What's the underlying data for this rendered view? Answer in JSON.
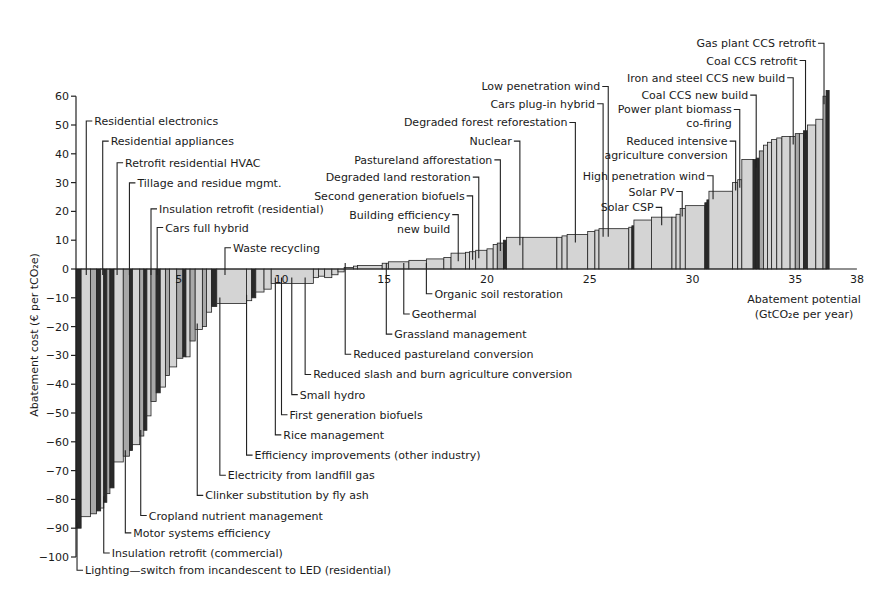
{
  "chart_data": {
    "type": "bar",
    "subtype": "marginal-abatement-cost-curve",
    "title": "",
    "xlabel": "Abatement potential (GtCO2e per year)",
    "xlabel_lines": [
      "Abatement potential",
      "(GtCO₂e per year)"
    ],
    "ylabel": "Abatement cost (€ per tCO₂e)",
    "xlim": [
      0,
      38
    ],
    "ylim": [
      -100,
      60
    ],
    "x_ticks": [
      5,
      10,
      15,
      20,
      25,
      30,
      35,
      38
    ],
    "y_ticks": [
      60,
      50,
      40,
      30,
      20,
      10,
      0,
      -10,
      -20,
      -30,
      -40,
      -50,
      -60,
      -70,
      -80,
      -90,
      -100
    ],
    "grid": false,
    "legend": null,
    "bars": [
      {
        "x": 0.0,
        "w": 0.25,
        "cost": -90,
        "shade": "dark"
      },
      {
        "x": 0.25,
        "w": 0.45,
        "cost": -86,
        "shade": "light"
      },
      {
        "x": 0.7,
        "w": 0.3,
        "cost": -85,
        "shade": "mid"
      },
      {
        "x": 1.0,
        "w": 0.2,
        "cost": -84,
        "shade": "dark"
      },
      {
        "x": 1.2,
        "w": 0.15,
        "cost": -83,
        "shade": "light"
      },
      {
        "x": 1.35,
        "w": 0.15,
        "cost": -81,
        "shade": "dark"
      },
      {
        "x": 1.5,
        "w": 0.15,
        "cost": -78,
        "shade": "mid"
      },
      {
        "x": 1.65,
        "w": 0.2,
        "cost": -76,
        "shade": "dark"
      },
      {
        "x": 1.85,
        "w": 0.45,
        "cost": -67,
        "shade": "light"
      },
      {
        "x": 2.3,
        "w": 0.3,
        "cost": -65,
        "shade": "mid"
      },
      {
        "x": 2.6,
        "w": 0.15,
        "cost": -63,
        "shade": "dark"
      },
      {
        "x": 2.75,
        "w": 0.35,
        "cost": -61,
        "shade": "light"
      },
      {
        "x": 3.1,
        "w": 0.2,
        "cost": -58,
        "shade": "mid"
      },
      {
        "x": 3.3,
        "w": 0.15,
        "cost": -56,
        "shade": "dark"
      },
      {
        "x": 3.45,
        "w": 0.2,
        "cost": -51,
        "shade": "light"
      },
      {
        "x": 3.65,
        "w": 0.25,
        "cost": -46,
        "shade": "mid"
      },
      {
        "x": 3.9,
        "w": 0.2,
        "cost": -43,
        "shade": "dark"
      },
      {
        "x": 4.1,
        "w": 0.25,
        "cost": -41,
        "shade": "light"
      },
      {
        "x": 4.35,
        "w": 0.2,
        "cost": -37,
        "shade": "mid"
      },
      {
        "x": 4.55,
        "w": 0.35,
        "cost": -34,
        "shade": "light"
      },
      {
        "x": 4.9,
        "w": 0.3,
        "cost": -31,
        "shade": "mid"
      },
      {
        "x": 5.2,
        "w": 0.15,
        "cost": -30.5,
        "shade": "dark"
      },
      {
        "x": 5.35,
        "w": 0.2,
        "cost": -30.5,
        "shade": "light"
      },
      {
        "x": 5.55,
        "w": 0.25,
        "cost": -25,
        "shade": "mid"
      },
      {
        "x": 5.8,
        "w": 0.35,
        "cost": -21,
        "shade": "light"
      },
      {
        "x": 6.15,
        "w": 0.2,
        "cost": -20,
        "shade": "mid"
      },
      {
        "x": 6.35,
        "w": 0.25,
        "cost": -15,
        "shade": "light"
      },
      {
        "x": 6.6,
        "w": 0.25,
        "cost": -13,
        "shade": "dark"
      },
      {
        "x": 6.85,
        "w": 1.45,
        "cost": -12,
        "shade": "light"
      },
      {
        "x": 8.3,
        "w": 0.25,
        "cost": -11,
        "shade": "light"
      },
      {
        "x": 8.55,
        "w": 0.2,
        "cost": -10,
        "shade": "dark"
      },
      {
        "x": 8.75,
        "w": 0.4,
        "cost": -8,
        "shade": "light"
      },
      {
        "x": 9.15,
        "w": 0.35,
        "cost": -7,
        "shade": "light"
      },
      {
        "x": 9.5,
        "w": 2.05,
        "cost": -5,
        "shade": "light"
      },
      {
        "x": 11.55,
        "w": 0.25,
        "cost": -3,
        "shade": "light"
      },
      {
        "x": 11.8,
        "w": 0.3,
        "cost": -2.5,
        "shade": "light"
      },
      {
        "x": 12.1,
        "w": 0.35,
        "cost": -3,
        "shade": "light"
      },
      {
        "x": 12.45,
        "w": 0.3,
        "cost": -2,
        "shade": "light"
      },
      {
        "x": 12.75,
        "w": 0.3,
        "cost": -1,
        "shade": "light"
      },
      {
        "x": 13.05,
        "w": 0.45,
        "cost": 0.5,
        "shade": "light"
      },
      {
        "x": 13.5,
        "w": 0.2,
        "cost": 1,
        "shade": "light"
      },
      {
        "x": 13.7,
        "w": 1.2,
        "cost": 1.2,
        "shade": "light"
      },
      {
        "x": 14.9,
        "w": 0.3,
        "cost": 2,
        "shade": "light"
      },
      {
        "x": 15.2,
        "w": 1.0,
        "cost": 2.5,
        "shade": "light"
      },
      {
        "x": 16.2,
        "w": 0.85,
        "cost": 3,
        "shade": "light"
      },
      {
        "x": 17.05,
        "w": 0.85,
        "cost": 3.5,
        "shade": "light"
      },
      {
        "x": 17.9,
        "w": 0.35,
        "cost": 4,
        "shade": "light"
      },
      {
        "x": 18.25,
        "w": 0.7,
        "cost": 5.5,
        "shade": "light"
      },
      {
        "x": 18.95,
        "w": 0.2,
        "cost": 5.8,
        "shade": "light"
      },
      {
        "x": 19.15,
        "w": 0.3,
        "cost": 6,
        "shade": "light"
      },
      {
        "x": 19.45,
        "w": 0.55,
        "cost": 6.5,
        "shade": "light"
      },
      {
        "x": 20.0,
        "w": 0.3,
        "cost": 7,
        "shade": "light"
      },
      {
        "x": 20.3,
        "w": 0.2,
        "cost": 8.5,
        "shade": "light"
      },
      {
        "x": 20.5,
        "w": 0.3,
        "cost": 9,
        "shade": "mid"
      },
      {
        "x": 20.8,
        "w": 0.15,
        "cost": 10,
        "shade": "dark"
      },
      {
        "x": 20.95,
        "w": 0.8,
        "cost": 11,
        "shade": "light"
      },
      {
        "x": 21.75,
        "w": 1.65,
        "cost": 11,
        "shade": "light"
      },
      {
        "x": 23.4,
        "w": 0.25,
        "cost": 11,
        "shade": "light"
      },
      {
        "x": 23.65,
        "w": 0.25,
        "cost": 11.5,
        "shade": "light"
      },
      {
        "x": 23.9,
        "w": 1.0,
        "cost": 12,
        "shade": "light"
      },
      {
        "x": 24.9,
        "w": 0.35,
        "cost": 13,
        "shade": "light"
      },
      {
        "x": 25.25,
        "w": 0.2,
        "cost": 13.5,
        "shade": "light"
      },
      {
        "x": 25.45,
        "w": 1.45,
        "cost": 14,
        "shade": "light"
      },
      {
        "x": 26.9,
        "w": 0.15,
        "cost": 14.5,
        "shade": "light"
      },
      {
        "x": 27.05,
        "w": 0.1,
        "cost": 15,
        "shade": "dark"
      },
      {
        "x": 27.15,
        "w": 0.85,
        "cost": 17,
        "shade": "light"
      },
      {
        "x": 28.0,
        "w": 1.0,
        "cost": 18,
        "shade": "light"
      },
      {
        "x": 29.0,
        "w": 0.2,
        "cost": 18,
        "shade": "light"
      },
      {
        "x": 29.2,
        "w": 0.2,
        "cost": 19,
        "shade": "light"
      },
      {
        "x": 29.4,
        "w": 0.25,
        "cost": 21,
        "shade": "light"
      },
      {
        "x": 29.65,
        "w": 0.95,
        "cost": 22,
        "shade": "light"
      },
      {
        "x": 30.6,
        "w": 0.1,
        "cost": 23,
        "shade": "dark"
      },
      {
        "x": 30.7,
        "w": 0.1,
        "cost": 24,
        "shade": "dark"
      },
      {
        "x": 30.8,
        "w": 1.15,
        "cost": 27,
        "shade": "light"
      },
      {
        "x": 31.95,
        "w": 0.25,
        "cost": 30,
        "shade": "light"
      },
      {
        "x": 32.2,
        "w": 0.2,
        "cost": 31,
        "shade": "light"
      },
      {
        "x": 32.4,
        "w": 0.55,
        "cost": 38,
        "shade": "light"
      },
      {
        "x": 32.95,
        "w": 0.15,
        "cost": 38,
        "shade": "dark"
      },
      {
        "x": 33.1,
        "w": 0.15,
        "cost": 38.5,
        "shade": "dark"
      },
      {
        "x": 33.25,
        "w": 0.2,
        "cost": 41,
        "shade": "mid"
      },
      {
        "x": 33.45,
        "w": 0.2,
        "cost": 43,
        "shade": "light"
      },
      {
        "x": 33.65,
        "w": 0.2,
        "cost": 44,
        "shade": "light"
      },
      {
        "x": 33.85,
        "w": 0.25,
        "cost": 45,
        "shade": "light"
      },
      {
        "x": 34.1,
        "w": 0.25,
        "cost": 45.5,
        "shade": "light"
      },
      {
        "x": 34.35,
        "w": 0.4,
        "cost": 46,
        "shade": "light"
      },
      {
        "x": 34.75,
        "w": 0.25,
        "cost": 46,
        "shade": "light"
      },
      {
        "x": 35.0,
        "w": 0.2,
        "cost": 47,
        "shade": "mid"
      },
      {
        "x": 35.2,
        "w": 0.2,
        "cost": 47,
        "shade": "light"
      },
      {
        "x": 35.4,
        "w": 0.2,
        "cost": 48,
        "shade": "dark"
      },
      {
        "x": 35.6,
        "w": 0.4,
        "cost": 50,
        "shade": "light"
      },
      {
        "x": 36.0,
        "w": 0.35,
        "cost": 52,
        "shade": "light"
      },
      {
        "x": 36.35,
        "w": 0.15,
        "cost": 60,
        "shade": "mid"
      },
      {
        "x": 36.5,
        "w": 0.15,
        "cost": 62,
        "shade": "dark"
      }
    ],
    "annotations": [
      {
        "label": "Residential electronics",
        "bar_x": 0.5,
        "side": "above",
        "y_text": 50
      },
      {
        "label": "Residential appliances",
        "bar_x": 1.3,
        "side": "above",
        "y_text": 43
      },
      {
        "label": "Retrofit residential HVAC",
        "bar_x": 2.0,
        "side": "above",
        "y_text": 35.5
      },
      {
        "label": "Tillage and residue mgmt.",
        "bar_x": 2.6,
        "side": "above",
        "y_text": 28.5
      },
      {
        "label": "Insulation retrofit (residential)",
        "bar_x": 3.65,
        "side": "above",
        "y_text": 19.5
      },
      {
        "label": "Cars full hybrid",
        "bar_x": 3.95,
        "side": "above",
        "y_text": 13
      },
      {
        "label": "Waste recycling",
        "bar_x": 7.25,
        "side": "above",
        "y_text": 6
      },
      {
        "label": "Building efficiency\nnew build",
        "bar_x": 18.6,
        "side": "above",
        "y_text": 17.5
      },
      {
        "label": "Second generation biofuels",
        "bar_x": 19.3,
        "side": "above",
        "y_text": 24
      },
      {
        "label": "Degraded land restoration",
        "bar_x": 19.6,
        "side": "above",
        "y_text": 30.5
      },
      {
        "label": "Pastureland afforestation",
        "bar_x": 20.65,
        "side": "above",
        "y_text": 36.5
      },
      {
        "label": "Nuclear",
        "bar_x": 21.6,
        "side": "above",
        "y_text": 43
      },
      {
        "label": "Degraded forest reforestation",
        "bar_x": 24.3,
        "side": "above",
        "y_text": 49.5
      },
      {
        "label": "Cars plug-in hybrid",
        "bar_x": 25.65,
        "side": "above",
        "y_text": 56
      },
      {
        "label": "Low penetration wind",
        "bar_x": 25.9,
        "side": "above",
        "y_text": 62
      },
      {
        "label": "Solar CSP",
        "bar_x": 28.5,
        "side": "above",
        "y_text": 20
      },
      {
        "label": "Solar PV",
        "bar_x": 29.5,
        "side": "above",
        "y_text": 25.5
      },
      {
        "label": "High penetration wind",
        "bar_x": 31.0,
        "side": "above",
        "y_text": 31
      },
      {
        "label": "Reduced intensive\nagriculture conversion",
        "bar_x": 32.1,
        "side": "above",
        "y_text": 43
      },
      {
        "label": "Power plant biomass\nco-firing",
        "bar_x": 32.3,
        "side": "above",
        "y_text": 54
      },
      {
        "label": "Coal CCS new build",
        "bar_x": 33.1,
        "side": "above",
        "y_text": 59
      },
      {
        "label": "Iron and steel CCS new build",
        "bar_x": 34.9,
        "side": "above",
        "y_text": 65
      },
      {
        "label": "Coal CCS retrofit",
        "bar_x": 35.5,
        "side": "above",
        "y_text": 71
      },
      {
        "label": "Gas plant CCS retrofit",
        "bar_x": 36.4,
        "side": "above",
        "y_text": 77
      },
      {
        "label": "Organic soil restoration",
        "bar_x": 17.05,
        "side": "below",
        "y_text": -10
      },
      {
        "label": "Geothermal",
        "bar_x": 15.95,
        "side": "below",
        "y_text": -17
      },
      {
        "label": "Grassland management",
        "bar_x": 15.1,
        "side": "below",
        "y_text": -24
      },
      {
        "label": "Reduced pastureland conversion",
        "bar_x": 13.1,
        "side": "below",
        "y_text": -31
      },
      {
        "label": "Reduced slash and burn agriculture conversion",
        "bar_x": 11.15,
        "side": "below",
        "y_text": -38
      },
      {
        "label": "Small hydro",
        "bar_x": 10.5,
        "side": "below",
        "y_text": -45
      },
      {
        "label": "First generation biofuels",
        "bar_x": 10.0,
        "side": "below",
        "y_text": -52
      },
      {
        "label": "Rice management",
        "bar_x": 9.7,
        "side": "below",
        "y_text": -59
      },
      {
        "label": "Efficiency improvements (other industry)",
        "bar_x": 8.3,
        "side": "below",
        "y_text": -66
      },
      {
        "label": "Electricity from landfill gas",
        "bar_x": 7.0,
        "side": "below",
        "y_text": -73
      },
      {
        "label": "Clinker substitution by fly ash",
        "bar_x": 5.9,
        "side": "below",
        "y_text": -80
      },
      {
        "label": "Cropland nutrient management",
        "bar_x": 3.15,
        "side": "below",
        "y_text": -87
      },
      {
        "label": "Motor systems efficiency",
        "bar_x": 2.4,
        "side": "below",
        "y_text": -93
      },
      {
        "label": "Insulation retrofit (commercial)",
        "bar_x": 1.35,
        "side": "below",
        "y_text": -100
      },
      {
        "label": "Lighting—switch from incandescent to LED (residential)",
        "bar_x": 0.05,
        "side": "below",
        "y_text": -106
      }
    ],
    "colors": {
      "light": "#d4d4d4",
      "mid": "#a8a8a8",
      "dark": "#2a2a2a",
      "stroke": "#222222",
      "background": "#ffffff"
    }
  }
}
